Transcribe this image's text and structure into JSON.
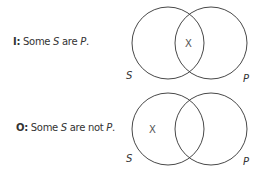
{
  "diagrams": [
    {
      "proposition_key": "I:",
      "proposition_parts": [
        "Some ",
        "S",
        " are ",
        "P",
        "."
      ],
      "label_left": "S",
      "label_right": "P",
      "mark": "X",
      "mark_region": "intersection"
    },
    {
      "proposition_key": "O:",
      "proposition_parts": [
        "Some ",
        "S",
        " are not ",
        "P",
        "."
      ],
      "label_left": "S",
      "label_right": "P",
      "mark": "X",
      "mark_region": "S-only"
    }
  ],
  "colors": {
    "stroke": "#333333",
    "text": "#333333"
  }
}
